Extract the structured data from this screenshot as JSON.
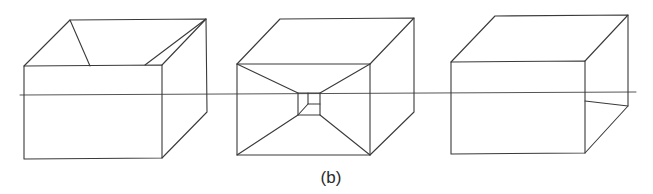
{
  "figure": {
    "caption": "(b)",
    "stroke_color": "#3a3a3a",
    "background_color": "#ffffff",
    "horizon_line": {
      "x1": 20,
      "y1": 95,
      "x2": 636,
      "y2": 92
    },
    "boxes": [
      {
        "name": "open-top-box",
        "front_face": [
          [
            24,
            66
          ],
          [
            162,
            65
          ],
          [
            162,
            158
          ],
          [
            24,
            159
          ]
        ],
        "back_top_left": [
          70,
          20
        ],
        "back_top_right": [
          206,
          19
        ],
        "back_bottom_right": [
          207,
          112
        ],
        "interior_lines": [
          [
            [
              70,
              20
            ],
            [
              90,
              66
            ]
          ],
          [
            [
              206,
              19
            ],
            [
              145,
              65
            ]
          ],
          [
            [
              206,
              19
            ],
            [
              162,
              65
            ]
          ]
        ]
      },
      {
        "name": "tunnel-box",
        "front_face": [
          [
            237,
            64
          ],
          [
            370,
            64
          ],
          [
            370,
            155
          ],
          [
            237,
            155
          ]
        ],
        "back_top_left": [
          280,
          19
        ],
        "back_top_right": [
          414,
          18
        ],
        "back_bottom_right": [
          414,
          112
        ],
        "inner_square": [
          [
            298,
            93
          ],
          [
            320,
            93
          ],
          [
            320,
            115
          ],
          [
            298,
            115
          ]
        ],
        "inner_small_square": [
          [
            308,
            93
          ],
          [
            320,
            93
          ],
          [
            320,
            104
          ],
          [
            308,
            104
          ]
        ],
        "interior_lines": [
          [
            [
              237,
              64
            ],
            [
              298,
              93
            ]
          ],
          [
            [
              370,
              64
            ],
            [
              320,
              93
            ]
          ],
          [
            [
              237,
              155
            ],
            [
              298,
              115
            ]
          ],
          [
            [
              370,
              155
            ],
            [
              320,
              115
            ]
          ],
          [
            [
              298,
              115
            ],
            [
              308,
              104
            ]
          ]
        ]
      },
      {
        "name": "solid-box",
        "front_face": [
          [
            451,
            62
          ],
          [
            585,
            61
          ],
          [
            585,
            153
          ],
          [
            451,
            154
          ]
        ],
        "back_top_left": [
          495,
          16
        ],
        "back_top_right": [
          628,
          15
        ],
        "back_bottom_right": [
          628,
          106
        ],
        "interior_lines": [
          [
            [
              585,
              101
            ],
            [
              628,
              106
            ]
          ]
        ]
      }
    ]
  }
}
